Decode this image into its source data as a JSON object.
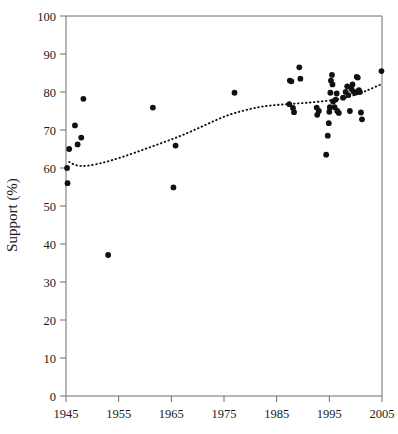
{
  "chart_data": {
    "type": "scatter",
    "title": "",
    "xlabel": "",
    "ylabel": "Support (%)",
    "xlim": [
      1945,
      2005
    ],
    "ylim": [
      0,
      100
    ],
    "xticks": [
      1945,
      1955,
      1965,
      1975,
      1985,
      1995,
      2005
    ],
    "xtick_labels": [
      "1945",
      "1955",
      "1965",
      "1975",
      "1985",
      "1995",
      "2005"
    ],
    "yticks": [
      0,
      10,
      20,
      30,
      40,
      50,
      60,
      70,
      80,
      90,
      100
    ],
    "ytick_labels": [
      "0",
      "10",
      "20",
      "30",
      "40",
      "50",
      "60",
      "70",
      "80",
      "90",
      "100"
    ],
    "grid": false,
    "legend": false,
    "marker_color": "#111111",
    "marker_shape": "filled-circle",
    "series": [
      {
        "name": "Support observations",
        "type": "scatter",
        "points": [
          [
            1945.2,
            60.0
          ],
          [
            1945.3,
            56.0
          ],
          [
            1945.6,
            65.0
          ],
          [
            1946.7,
            71.2
          ],
          [
            1947.2,
            66.2
          ],
          [
            1947.9,
            68.0
          ],
          [
            1948.3,
            78.2
          ],
          [
            1953.0,
            37.1
          ],
          [
            1961.5,
            75.9
          ],
          [
            1965.8,
            65.9
          ],
          [
            1965.4,
            54.9
          ],
          [
            1977.0,
            79.8
          ],
          [
            1987.4,
            76.8
          ],
          [
            1987.5,
            83.0
          ],
          [
            1987.8,
            82.8
          ],
          [
            1988.1,
            75.8
          ],
          [
            1988.3,
            74.7
          ],
          [
            1989.3,
            86.5
          ],
          [
            1989.5,
            83.5
          ],
          [
            1992.6,
            75.9
          ],
          [
            1992.7,
            74.0
          ],
          [
            1993.0,
            75.0
          ],
          [
            1994.4,
            63.5
          ],
          [
            1994.7,
            68.5
          ],
          [
            1994.9,
            71.8
          ],
          [
            1995.0,
            74.8
          ],
          [
            1995.1,
            76.0
          ],
          [
            1995.2,
            79.8
          ],
          [
            1995.3,
            83.0
          ],
          [
            1995.5,
            84.5
          ],
          [
            1995.6,
            82.0
          ],
          [
            1995.7,
            77.5
          ],
          [
            1996.0,
            76.0
          ],
          [
            1996.2,
            78.0
          ],
          [
            1996.4,
            79.6
          ],
          [
            1996.5,
            75.0
          ],
          [
            1996.8,
            74.5
          ],
          [
            1997.6,
            78.5
          ],
          [
            1998.1,
            80.0
          ],
          [
            1998.4,
            81.5
          ],
          [
            1998.6,
            79.2
          ],
          [
            1998.9,
            75.0
          ],
          [
            1999.2,
            80.8
          ],
          [
            1999.4,
            82.0
          ],
          [
            1999.6,
            80.1
          ],
          [
            1999.9,
            79.8
          ],
          [
            2000.2,
            84.0
          ],
          [
            2000.4,
            83.8
          ],
          [
            2000.6,
            80.5
          ],
          [
            2000.8,
            80.0
          ],
          [
            2001.0,
            74.6
          ],
          [
            2001.2,
            72.8
          ],
          [
            2004.9,
            85.5
          ]
        ]
      },
      {
        "name": "Fitted trend",
        "type": "line",
        "style": "dotted",
        "color": "#111111",
        "points": [
          [
            1945.6,
            61.6
          ],
          [
            1947.0,
            60.7
          ],
          [
            1949.0,
            60.6
          ],
          [
            1952.0,
            61.4
          ],
          [
            1955.0,
            62.6
          ],
          [
            1958.0,
            64.0
          ],
          [
            1961.0,
            65.5
          ],
          [
            1964.0,
            67.0
          ],
          [
            1967.0,
            68.6
          ],
          [
            1970.0,
            70.4
          ],
          [
            1973.0,
            72.3
          ],
          [
            1976.0,
            74.0
          ],
          [
            1979.0,
            75.2
          ],
          [
            1982.0,
            76.1
          ],
          [
            1985.0,
            76.6
          ],
          [
            1988.0,
            76.9
          ],
          [
            1991.0,
            77.2
          ],
          [
            1994.0,
            77.6
          ],
          [
            1997.0,
            78.2
          ],
          [
            2000.0,
            79.3
          ],
          [
            2002.5,
            80.6
          ],
          [
            2004.6,
            81.9
          ]
        ]
      }
    ]
  },
  "axes": {
    "y_axis_label": "Support (%)"
  }
}
